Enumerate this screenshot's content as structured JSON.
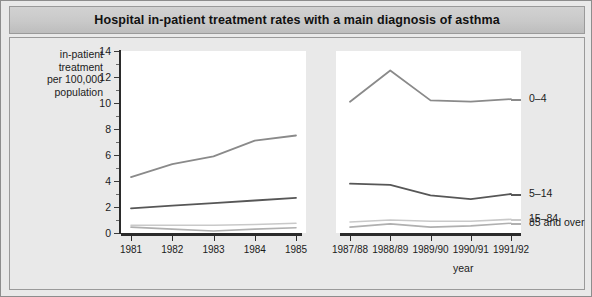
{
  "title": "Hospital in-patient treatment rates with a main diagnosis of asthma",
  "axes": {
    "ylabel_lines": [
      "in-patient",
      "treatment",
      "per 100,000",
      "population"
    ],
    "xlabel": "year",
    "ytick_labels": [
      "0",
      "2",
      "4",
      "6",
      "8",
      "10",
      "12",
      "14"
    ]
  },
  "colors": {
    "background": "#e9e9e9",
    "plot_background": "#ffffff",
    "title_bar": "#c9c9c9",
    "axis": "#2b2b2b",
    "series_0_4": "#8a8a8a",
    "series_5_14": "#575757",
    "series_15_84": "#c9c9c9",
    "series_85_and_over": "#b0b0b0"
  },
  "chart_data": {
    "type": "line",
    "title": "Hospital in-patient treatment rates with a main diagnosis of asthma",
    "xlabel": "year",
    "ylabel": "in-patient treatment per 100,000 population",
    "ylim": [
      0,
      14
    ],
    "yticks": [
      0,
      2,
      4,
      6,
      8,
      10,
      12,
      14
    ],
    "grid": false,
    "legend_position": "right-inline",
    "categories": [
      "1981",
      "1982",
      "1983",
      "1984",
      "1985",
      "1987/88",
      "1988/89",
      "1989/90",
      "1990/91",
      "1991/92"
    ],
    "panel_break_after": "1985",
    "series": [
      {
        "name": "0–4",
        "values": [
          4.3,
          5.3,
          5.9,
          7.1,
          7.5,
          10.1,
          12.5,
          10.2,
          10.1,
          10.3
        ]
      },
      {
        "name": "5–14",
        "values": [
          1.9,
          2.1,
          2.3,
          2.5,
          2.7,
          3.8,
          3.7,
          2.9,
          2.6,
          3.0
        ]
      },
      {
        "name": "15–84",
        "values": [
          0.6,
          0.6,
          0.6,
          0.65,
          0.75,
          0.85,
          1.0,
          0.9,
          0.9,
          1.05
        ]
      },
      {
        "name": "85 and over",
        "values": [
          0.45,
          0.3,
          0.15,
          0.3,
          0.4,
          0.45,
          0.7,
          0.45,
          0.55,
          0.75
        ]
      }
    ]
  }
}
